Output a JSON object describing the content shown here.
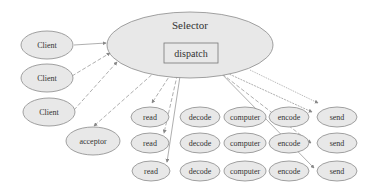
{
  "diagram": {
    "selector": {
      "label": "Selector",
      "cx": 190,
      "cy": 45,
      "rx": 83,
      "ry": 33
    },
    "dispatch": {
      "label": "dispatch",
      "x": 164,
      "y": 43,
      "w": 54,
      "h": 20
    },
    "clients": [
      {
        "label": "Client",
        "cx": 47,
        "cy": 45
      },
      {
        "label": "Client",
        "cx": 47,
        "cy": 78
      },
      {
        "label": "Client",
        "cx": 47,
        "cy": 112
      }
    ],
    "acceptor": {
      "label": "acceptor",
      "cx": 93,
      "cy": 141
    },
    "rows": [
      {
        "y": 117,
        "read": "read",
        "decode": "decode",
        "computer": "computer",
        "encode": "encode",
        "send": "send"
      },
      {
        "y": 143,
        "read": "read",
        "decode": "decode",
        "computer": "computer",
        "encode": "encode",
        "send": "send"
      },
      {
        "y": 171,
        "read": "read",
        "decode": "decode",
        "computer": "computer",
        "encode": "encode",
        "send": "send"
      }
    ],
    "colors": {
      "node_fill": "#e8e8e8",
      "stroke": "#8a8a8a",
      "edge": "#999999",
      "text": "#333333"
    }
  }
}
